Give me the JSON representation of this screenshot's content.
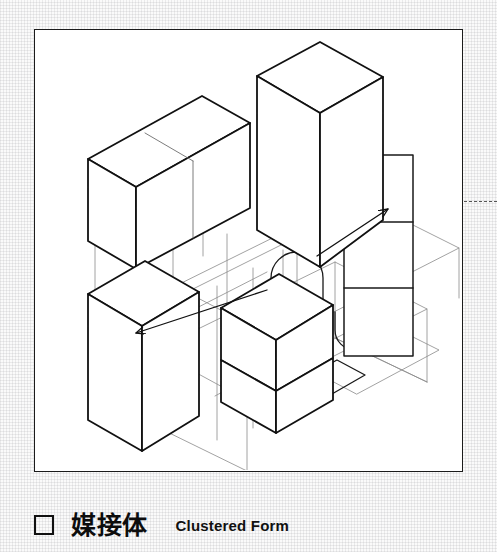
{
  "page": {
    "width": 497,
    "height": 552,
    "background_color": "#fafafa",
    "texture": "fine-woven-grid-paper"
  },
  "plate": {
    "border_color": "#1b1b1b",
    "fill_color": "#ffffff",
    "x": 34,
    "y": 29,
    "width": 429,
    "height": 443,
    "title": "Clustered Form isometric diagram"
  },
  "diagram": {
    "type": "axonometric-architectural-massing",
    "line_colors": {
      "heavy_outline": "#111111",
      "thin_construction": "#6d6d6d",
      "arrow": "#111111"
    },
    "volumes": [
      {
        "name": "upper-left-block",
        "role": "wide horizontal mass"
      },
      {
        "name": "upper-center-tower",
        "role": "tall vertical mass"
      },
      {
        "name": "lower-left-block",
        "role": "lower vertical mass"
      },
      {
        "name": "lower-center-block",
        "role": "lower vertical mass"
      },
      {
        "name": "right-panel",
        "role": "flat subdivided elevation panel, 3 bays"
      }
    ],
    "connectors": [
      {
        "name": "loop-connector-left",
        "shape": "rounded-hook"
      },
      {
        "name": "loop-connector-center",
        "shape": "rounded-hook"
      },
      {
        "name": "loop-connector-right",
        "shape": "rounded-hook"
      }
    ],
    "arrows": [
      {
        "name": "arrow-left",
        "direction": "down-left"
      },
      {
        "name": "arrow-right",
        "direction": "up-right"
      }
    ],
    "edge_leader": {
      "name": "edge-dashed-leader",
      "style": "dashed",
      "color": "#555555"
    }
  },
  "caption": {
    "marker": "empty-square",
    "japanese_label": "媒接体",
    "english_label": "Clustered Form"
  }
}
